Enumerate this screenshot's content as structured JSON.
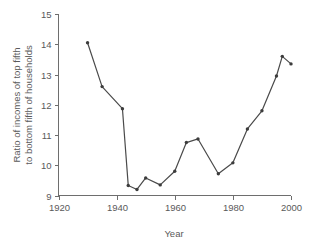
{
  "chart_data": {
    "type": "line",
    "title": "",
    "xlabel": "Year",
    "ylabel": "Ratio of incomes of top fifth to bottom fifth of households",
    "ylabel_line1": "Ratio of incomes of top fifth",
    "ylabel_line2": "to bottom fifth of households",
    "xlim": [
      1920,
      2000
    ],
    "ylim": [
      9,
      15
    ],
    "xticks": [
      1920,
      1940,
      1960,
      1980,
      2000
    ],
    "yticks": [
      9,
      10,
      11,
      12,
      13,
      14,
      15
    ],
    "xtick_labels": [
      "1920",
      "1940",
      "1960",
      "1980",
      "2000"
    ],
    "ytick_labels": [
      "9",
      "10",
      "11",
      "12",
      "13",
      "14",
      "15"
    ],
    "grid": false,
    "legend": false,
    "marker": "dot",
    "line_color": "#4a4a4a",
    "marker_color": "#3c3c3c",
    "axis_color": "#6e6e6e",
    "background": "#ffffff",
    "x": [
      1930,
      1935,
      1942,
      1944,
      1947,
      1950,
      1955,
      1960,
      1964,
      1968,
      1975,
      1980,
      1985,
      1990,
      1995,
      1997,
      2000
    ],
    "values": [
      14.05,
      12.6,
      11.87,
      9.33,
      9.2,
      9.58,
      9.35,
      9.8,
      10.75,
      10.87,
      9.72,
      10.08,
      11.2,
      11.8,
      12.95,
      13.6,
      13.35
    ],
    "series": [
      {
        "name": "Ratio of incomes of top fifth to bottom fifth of households",
        "values": [
          14.05,
          12.6,
          11.87,
          9.33,
          9.2,
          9.58,
          9.35,
          9.8,
          10.75,
          10.87,
          9.72,
          10.08,
          11.2,
          11.8,
          12.95,
          13.6,
          13.35
        ]
      }
    ]
  }
}
